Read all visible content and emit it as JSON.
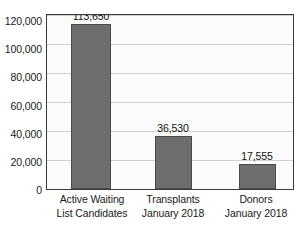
{
  "chart_data": {
    "type": "bar",
    "title": "",
    "subtitle": "",
    "xlabel": "",
    "ylabel": "",
    "ylim": [
      0,
      120000
    ],
    "grid": true,
    "legend": false,
    "legend_position": "none",
    "y_ticks": [
      "0",
      "20,000",
      "40,000",
      "60,000",
      "80,000",
      "100,000",
      "120,000"
    ],
    "y_tick_values": [
      0,
      20000,
      40000,
      60000,
      80000,
      100000,
      120000
    ],
    "categories": [
      "Active Waiting List Candidates",
      "Transplants January 2018",
      "Donors January 2018"
    ],
    "category_lines": [
      [
        "Active Waiting",
        "List Candidates"
      ],
      [
        "Transplants",
        "January 2018"
      ],
      [
        "Donors",
        "January 2018"
      ]
    ],
    "values": [
      113650,
      36530,
      17555
    ],
    "value_labels": [
      "113,650",
      "36,530",
      "17,555"
    ],
    "colors": {
      "bar_fill": "#6e6e6e",
      "bar_stroke": "#4a4a4a",
      "gridline": "#d0d0d0",
      "frame": "#3a3a3a",
      "plot_background": "#fbfbfb",
      "text": "#1a1a1a"
    }
  }
}
